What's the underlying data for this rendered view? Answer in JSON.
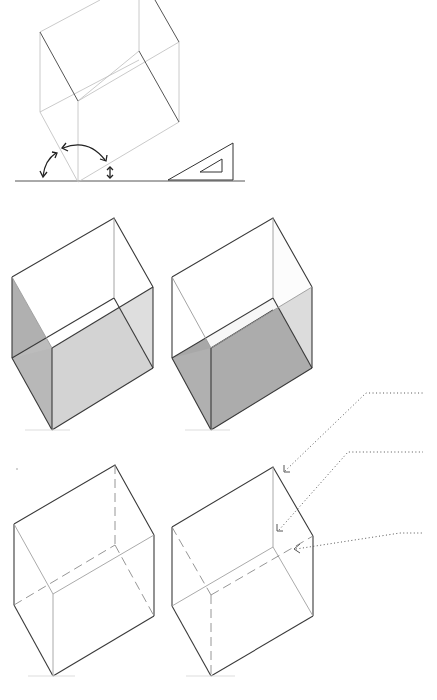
{
  "figure": {
    "colors": {
      "background": "#ffffff",
      "line_dark": "#3a3a3a",
      "line_light": "#b8b8b8",
      "shade_light": "#dcdcdc",
      "shade_mid": "#b9b9b9",
      "shade_dark": "#a8a8a8",
      "leader": "#555555"
    }
  },
  "panels": {
    "construction": {
      "label": "construction-cube",
      "ground_line": {
        "x1": 15,
        "x2": 245,
        "y": 181
      },
      "set_square": {
        "outer": [
          [
            168,
            180
          ],
          [
            233,
            143
          ],
          [
            233,
            180
          ]
        ],
        "inner": [
          [
            200,
            172
          ],
          [
            222,
            159
          ],
          [
            222,
            172
          ]
        ]
      },
      "angle_arrows": [
        "left-30deg-arrow",
        "vertical-120deg-arrow",
        "small-right-arrow"
      ]
    },
    "shaded_cube_a": {
      "label": "cube-shaded-left-faces"
    },
    "shaded_cube_b": {
      "label": "cube-shaded-bottom-face"
    },
    "hidden_cube_a": {
      "label": "cube-hidden-lines-a"
    },
    "hidden_cube_b": {
      "label": "cube-hidden-lines-b"
    }
  },
  "callouts": [
    {
      "id": "callout-1",
      "text": ""
    },
    {
      "id": "callout-2",
      "text": ""
    },
    {
      "id": "callout-3",
      "text": ""
    }
  ]
}
